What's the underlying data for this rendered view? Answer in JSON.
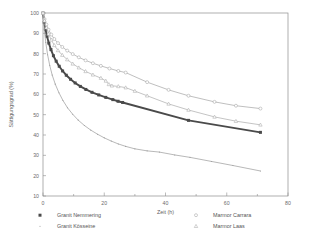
{
  "chart_data": {
    "type": "line",
    "title": "",
    "xlabel": "Zeit (h)",
    "ylabel": "Sättigungsgrad (%)",
    "xlim": [
      0,
      80
    ],
    "ylim": [
      10,
      100
    ],
    "xticks": [
      0,
      20,
      40,
      60,
      80
    ],
    "xticklabels": [
      "0",
      "20",
      "40",
      "60",
      "80"
    ],
    "xminorticks": [
      10,
      30,
      50,
      70
    ],
    "yticks": [
      10,
      20,
      30,
      40,
      50,
      60,
      70,
      80,
      90,
      100
    ],
    "yticklabels": [
      "10",
      "20",
      "30",
      "40",
      "50",
      "60",
      "70",
      "80",
      "90",
      "100"
    ],
    "grid": false,
    "legend_position": "below-plot",
    "series": [
      {
        "name": "Granit Nemmering",
        "marker": "filled-square",
        "color": "#4a4a4a",
        "linewidth": 1.9,
        "x": [
          0,
          0.4,
          0.8,
          1.3,
          1.9,
          2.6,
          3.4,
          4.3,
          5.3,
          6.4,
          7.6,
          9.0,
          10.5,
          12.2,
          14.0,
          16.0,
          18.2,
          20.5,
          22.8,
          24.5,
          26.0,
          47.5,
          71.0
        ],
        "y": [
          100,
          95.5,
          92.0,
          88.6,
          85.2,
          82.0,
          79.0,
          76.3,
          73.8,
          71.5,
          69.4,
          67.4,
          65.6,
          63.9,
          62.4,
          61.0,
          59.7,
          58.5,
          57.4,
          56.6,
          56.0,
          47.2,
          41.3
        ]
      },
      {
        "name": "Granit Kösseine",
        "marker": "dot",
        "color": "#9a9a9a",
        "linewidth": 0.7,
        "x": [
          0,
          0.4,
          0.9,
          1.5,
          2.2,
          3.0,
          4.0,
          5.2,
          6.5,
          8.0,
          9.7,
          11.5,
          13.5,
          15.6,
          17.8,
          20.0,
          22.3,
          24.6,
          27.0,
          30.0,
          34.0,
          38.0,
          43.0,
          48.0,
          55.0,
          62.0,
          71.0
        ],
        "y": [
          100,
          92.0,
          85.5,
          79.5,
          74.2,
          69.5,
          65.0,
          60.8,
          57.0,
          53.4,
          50.2,
          47.3,
          44.7,
          42.4,
          40.4,
          38.6,
          37.0,
          35.6,
          34.4,
          33.2,
          32.2,
          31.6,
          30.2,
          29.0,
          27.0,
          25.0,
          22.3
        ]
      },
      {
        "name": "Marmor Carrara",
        "marker": "open-circle",
        "color": "#a3a3a3",
        "linewidth": 0.7,
        "x": [
          0,
          0.5,
          1.1,
          1.8,
          2.7,
          3.7,
          4.9,
          6.3,
          7.9,
          9.7,
          11.7,
          13.9,
          16.3,
          18.9,
          21.7,
          24.6,
          27.0,
          34.0,
          41.0,
          47.5,
          56.0,
          63.0,
          71.0
        ],
        "y": [
          100,
          97.0,
          94.3,
          91.8,
          89.4,
          87.2,
          85.2,
          83.3,
          81.5,
          79.8,
          78.2,
          76.7,
          75.3,
          74.0,
          72.7,
          71.5,
          70.7,
          66.0,
          62.2,
          59.3,
          56.3,
          54.4,
          53.0
        ]
      },
      {
        "name": "Marmor Laas",
        "marker": "open-triangle",
        "color": "#ababab",
        "linewidth": 0.7,
        "x": [
          0,
          0.5,
          1.1,
          1.8,
          2.7,
          3.7,
          4.9,
          6.3,
          7.9,
          9.7,
          11.7,
          13.9,
          16.3,
          18.9,
          20.5,
          21.5,
          22.5,
          24.6,
          27.0,
          30.0,
          34.0,
          41.0,
          47.5,
          56.0,
          63.0,
          71.0
        ],
        "y": [
          100,
          96.2,
          92.8,
          89.7,
          86.8,
          84.1,
          81.6,
          79.3,
          77.1,
          75.0,
          73.1,
          71.3,
          69.6,
          68.0,
          66.6,
          64.9,
          64.2,
          63.9,
          63.3,
          61.6,
          59.3,
          55.3,
          52.3,
          48.9,
          46.8,
          45.0
        ]
      }
    ]
  },
  "legend": {
    "entries": [
      {
        "label": "Granit Nemmering",
        "marker": "filled-square",
        "color": "#4a4a4a"
      },
      {
        "label": "Granit Kösseine",
        "marker": "dot",
        "color": "#9a9a9a"
      },
      {
        "label": "Marmor Carrara",
        "marker": "open-circle",
        "color": "#a3a3a3"
      },
      {
        "label": "Marmor Laas",
        "marker": "open-triangle",
        "color": "#ababab"
      }
    ]
  }
}
